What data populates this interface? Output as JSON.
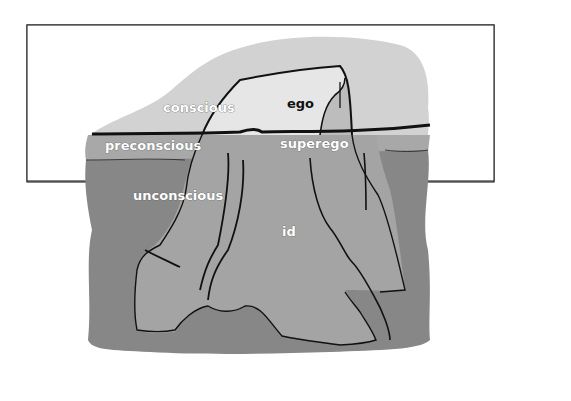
{
  "diagram": {
    "levels": {
      "conscious": "conscious",
      "preconscious": "preconscious",
      "unconscious": "unconscious"
    },
    "structures": {
      "ego": "ego",
      "superego": "superego",
      "id": "id"
    },
    "colors": {
      "background": "#ffffff",
      "frame": "#333333",
      "sky": "#d2d2d2",
      "iceberg_above": "#e6e6e6",
      "preconscious_band": "#a8a8a8",
      "deep_water": "#878787",
      "iceberg_below": "#a4a4a4",
      "lines": "#111111"
    }
  }
}
